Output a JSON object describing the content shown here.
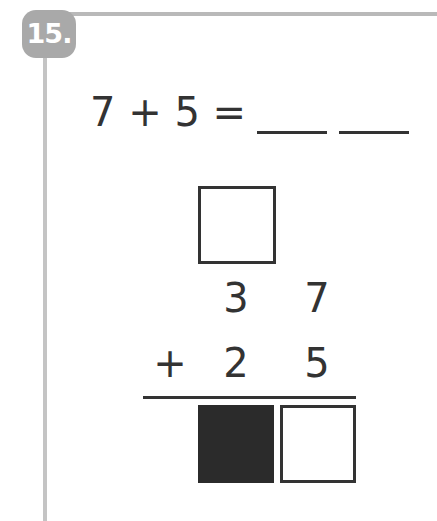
{
  "problem": {
    "number_badge": "15.",
    "equation": {
      "text": "7 + 5 =",
      "blanks": 2
    },
    "vertical_addition": {
      "carry_box": "",
      "top_row": {
        "tens": "3",
        "ones": "7"
      },
      "operator": "+",
      "bottom_row": {
        "tens": "2",
        "ones": "5"
      },
      "answer_boxes": [
        {
          "value": "",
          "filled": true
        },
        {
          "value": "",
          "filled": false
        }
      ]
    }
  },
  "colors": {
    "text": "#333333",
    "badge": "#a9a9a9",
    "rule": "#b9b9b9",
    "filled_box": "#2b2b2b"
  }
}
